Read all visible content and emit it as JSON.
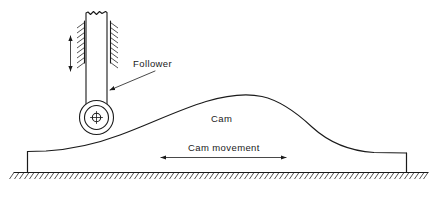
{
  "figure": {
    "background_color": "#ffffff",
    "ink_color": "#1a1a1a",
    "width": 439,
    "height": 200
  },
  "labels": {
    "follower": "Follower",
    "cam": "Cam",
    "cam_movement": "Cam movement"
  },
  "annotations": {
    "follower_motion_arrow": "vertical-double-arrow",
    "cam_movement_arrow": "horizontal-double-arrow"
  },
  "parts": {
    "guide": "guide-hatching",
    "stem": "follower-stem",
    "roller": "roller-wheel",
    "hub": "roller-hub-center",
    "cam_profile": "cam-surface-curve",
    "base": "cam-base-block",
    "ground": "ground-line-hatched"
  }
}
